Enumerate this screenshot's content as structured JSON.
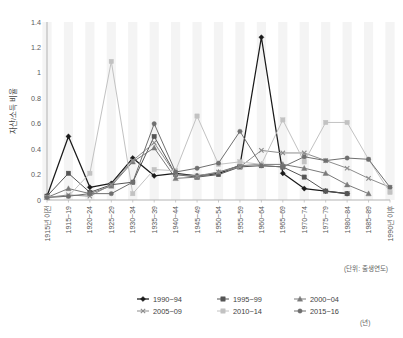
{
  "chart_data": {
    "type": "line",
    "title": "",
    "xlabel": "(단위: 출생연도)",
    "ylabel": "자산/소득 비율",
    "x_unit_note": "(년)",
    "ylim": [
      0,
      1.4
    ],
    "y_ticks": [
      "0",
      "0.2",
      "0.4",
      "0.6",
      "0.8",
      "1",
      "1.2",
      "1.4"
    ],
    "y_tick_values": [
      0,
      0.2,
      0.4,
      0.6,
      0.8,
      1.0,
      1.2,
      1.4
    ],
    "grid": "vertical-bands",
    "legend_position": "bottom",
    "categories": [
      "1915년 이전",
      "1915~19",
      "1920~24",
      "1925~29",
      "1930~34",
      "1935~39",
      "1940~44",
      "1945~49",
      "1950~54",
      "1955~59",
      "1960~64",
      "1965~69",
      "1970~74",
      "1975~79",
      "1980~84",
      "1985~89",
      "1990년 이후"
    ],
    "series": [
      {
        "name": "1990~94",
        "marker": "diamond",
        "color": "#1a1a1a",
        "values": [
          0.03,
          0.5,
          0.1,
          0.13,
          0.33,
          0.19,
          0.21,
          0.19,
          0.21,
          0.27,
          1.28,
          0.21,
          0.09,
          0.07,
          0.05,
          null,
          null
        ]
      },
      {
        "name": "1995~99",
        "marker": "square",
        "color": "#555555",
        "values": [
          0.03,
          0.21,
          0.06,
          0.12,
          0.14,
          0.5,
          0.2,
          0.18,
          0.2,
          0.26,
          0.27,
          0.26,
          0.18,
          0.07,
          0.05,
          null,
          null
        ]
      },
      {
        "name": "2000~04",
        "marker": "triangle",
        "color": "#7a7a7a",
        "values": [
          0.02,
          0.09,
          0.05,
          0.11,
          0.3,
          0.41,
          0.17,
          0.18,
          0.22,
          0.27,
          0.28,
          0.28,
          0.25,
          0.21,
          0.12,
          0.05,
          null
        ]
      },
      {
        "name": "2005~09",
        "marker": "x",
        "color": "#8d8d8d",
        "values": [
          0.02,
          0.04,
          0.03,
          0.12,
          0.31,
          0.45,
          0.2,
          0.19,
          0.22,
          0.26,
          0.39,
          0.37,
          0.37,
          0.31,
          0.25,
          0.17,
          0.1
        ]
      },
      {
        "name": "2010~14",
        "marker": "square-light",
        "color": "#c2c2c2",
        "values": [
          0.02,
          0.03,
          0.21,
          1.09,
          0.05,
          0.24,
          0.23,
          0.66,
          0.28,
          0.3,
          0.28,
          0.63,
          0.3,
          0.61,
          0.61,
          0.32,
          0.06
        ]
      },
      {
        "name": "2015~16",
        "marker": "circle",
        "color": "#6f6f6f",
        "values": [
          0.02,
          0.03,
          0.05,
          0.05,
          0.14,
          0.6,
          0.22,
          0.25,
          0.29,
          0.54,
          0.27,
          0.26,
          0.34,
          0.31,
          0.33,
          0.32,
          0.1
        ]
      }
    ],
    "legend": [
      {
        "label": "1990~94",
        "marker": "diamond",
        "color": "#1a1a1a"
      },
      {
        "label": "1995~99",
        "marker": "square",
        "color": "#555555"
      },
      {
        "label": "2000~04",
        "marker": "triangle",
        "color": "#7a7a7a"
      },
      {
        "label": "2005~09",
        "marker": "x",
        "color": "#8d8d8d"
      },
      {
        "label": "2010~14",
        "marker": "square-light",
        "color": "#c2c2c2"
      },
      {
        "label": "2015~16",
        "marker": "circle",
        "color": "#6f6f6f"
      }
    ]
  }
}
